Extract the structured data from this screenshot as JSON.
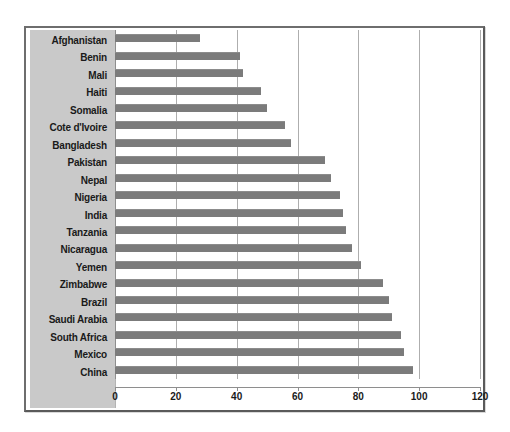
{
  "chart_data": {
    "type": "bar",
    "orientation": "horizontal",
    "title": "",
    "subtitle": "",
    "xlabel": "",
    "ylabel": "",
    "xlim": [
      0,
      120
    ],
    "xticks": [
      0,
      20,
      40,
      60,
      80,
      100,
      120
    ],
    "xtick_labels": [
      "0",
      "20",
      "40",
      "60",
      "80",
      "100",
      "120"
    ],
    "grid": true,
    "grid_axis": "x",
    "legend": false,
    "legend_position": "none",
    "categories": [
      "Afghanistan",
      "Benin",
      "Mali",
      "Haiti",
      "Somalia",
      "Cote d'Ivoire",
      "Bangladesh",
      "Pakistan",
      "Nepal",
      "Nigeria",
      "India",
      "Tanzania",
      "Nicaragua",
      "Yemen",
      "Zimbabwe",
      "Brazil",
      "Saudi Arabia",
      "South Africa",
      "Mexico",
      "China"
    ],
    "values": [
      28,
      41,
      42,
      48,
      50,
      56,
      58,
      69,
      71,
      74,
      75,
      76,
      78,
      81,
      88,
      90,
      91,
      94,
      95,
      98
    ],
    "series": [
      {
        "name": "",
        "color": "#7b7b7b",
        "values": [
          28,
          41,
          42,
          48,
          50,
          56,
          58,
          69,
          71,
          74,
          75,
          76,
          78,
          81,
          88,
          90,
          91,
          94,
          95,
          98
        ]
      }
    ]
  },
  "colors": {
    "bar": "#7b7b7b",
    "label_panel": "#c9c9c9",
    "gridline": "#aeaeae",
    "axis": "#8e8e8e",
    "frame": "#5a5a5a",
    "text": "#1a1a1a",
    "plot_background": "#ffffff"
  }
}
